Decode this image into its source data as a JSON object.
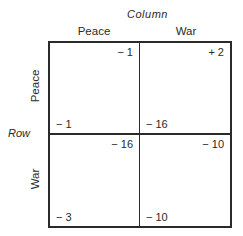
{
  "column_player": {
    "label": "Column",
    "strategies": [
      "Peace",
      "War"
    ]
  },
  "row_player": {
    "label": "Row",
    "strategies": [
      "Peace",
      "War"
    ]
  },
  "payoffs": [
    [
      {
        "row": "− 1",
        "column": "− 1"
      },
      {
        "row": "− 16",
        "column": "+ 2"
      }
    ],
    [
      {
        "row": "− 3",
        "column": "− 16"
      },
      {
        "row": "− 10",
        "column": "− 10"
      }
    ]
  ],
  "colors": {
    "line": "#2a2a2a",
    "text": "#2a2a2a",
    "background": "#ffffff"
  }
}
